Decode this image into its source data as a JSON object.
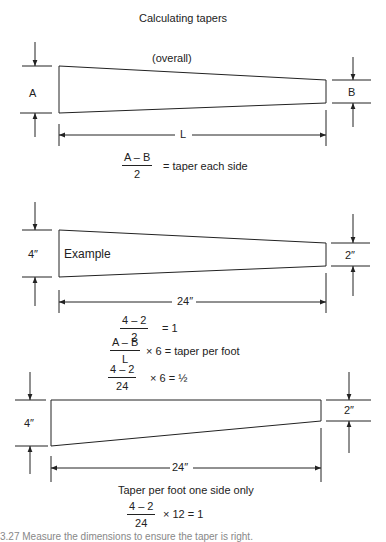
{
  "title": "Calculating tapers",
  "section1": {
    "subtitle": "(overall)",
    "label_left": "A",
    "label_right": "B",
    "label_length": "L",
    "formula": {
      "numerator": "A – B",
      "denominator": "2",
      "result": "= taper each side"
    }
  },
  "section2": {
    "label_inside": "Example",
    "label_left": "4″",
    "label_right": "2″",
    "label_length": "24″",
    "formula1": {
      "numerator": "4 – 2",
      "denominator": "2",
      "result": "= 1"
    },
    "formula2": {
      "numerator": "A – B",
      "denominator": "L",
      "result": "× 6  =  taper per foot"
    },
    "formula3": {
      "numerator": "4 – 2",
      "denominator": "24",
      "result": "×  6  =  ½"
    }
  },
  "section3": {
    "label_left": "4″",
    "label_right": "2″",
    "label_length": "24″",
    "heading": "Taper per foot one side only",
    "formula": {
      "numerator": "4 – 2",
      "denominator": "24",
      "result": "× 12  =  1"
    }
  },
  "caption": "3.27  Measure the dimensions to ensure the taper is right."
}
